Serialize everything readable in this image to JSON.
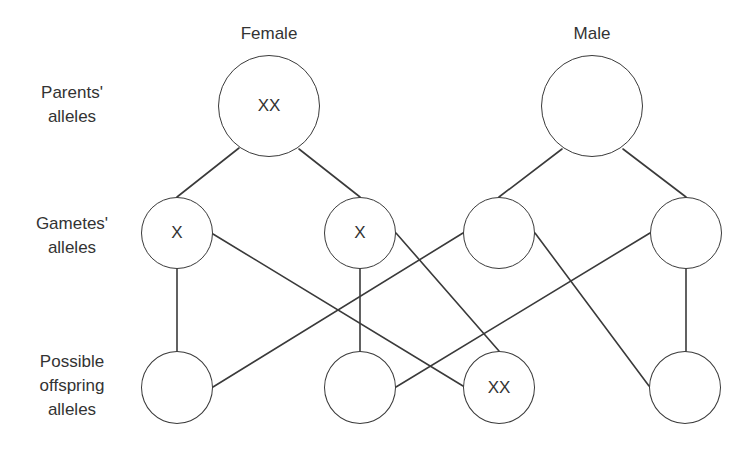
{
  "columns": {
    "female": "Female",
    "male": "Male"
  },
  "rows": {
    "parents": [
      "Parents'",
      "alleles"
    ],
    "gametes": [
      "Gametes'",
      "alleles"
    ],
    "offspring": [
      "Possible",
      "offspring",
      "alleles"
    ]
  },
  "nodes": {
    "parent_female": "XX",
    "parent_male": "",
    "gamete_female_1": "X",
    "gamete_female_2": "X",
    "gamete_male_1": "",
    "gamete_male_2": "",
    "offspring_1": "",
    "offspring_2": "",
    "offspring_3": "XX",
    "offspring_4": ""
  },
  "edges": [
    {
      "from": "parent_female",
      "to": "gamete_female_1"
    },
    {
      "from": "parent_female",
      "to": "gamete_female_2"
    },
    {
      "from": "parent_male",
      "to": "gamete_male_1"
    },
    {
      "from": "parent_male",
      "to": "gamete_male_2"
    },
    {
      "from": "gamete_female_1",
      "to": "offspring_1"
    },
    {
      "from": "gamete_female_1",
      "to": "offspring_3"
    },
    {
      "from": "gamete_female_2",
      "to": "offspring_2"
    },
    {
      "from": "gamete_female_2",
      "to": "offspring_3"
    },
    {
      "from": "gamete_male_1",
      "to": "offspring_1"
    },
    {
      "from": "gamete_male_1",
      "to": "offspring_4"
    },
    {
      "from": "gamete_male_2",
      "to": "offspring_2"
    },
    {
      "from": "gamete_male_2",
      "to": "offspring_4"
    }
  ],
  "colors": {
    "stroke": "#3a3a3a",
    "text": "#333333",
    "background": "#ffffff"
  }
}
